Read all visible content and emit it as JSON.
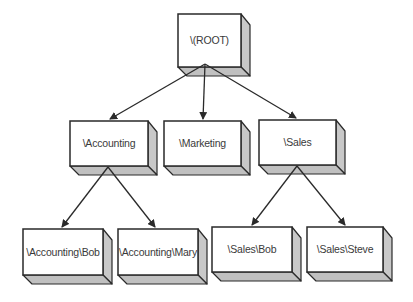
{
  "diagram": {
    "type": "tree",
    "nodes": [
      {
        "id": "root",
        "label": "\\(ROOT)",
        "x": 178,
        "y": 14,
        "w": 63,
        "h": 53
      },
      {
        "id": "accounting",
        "label": "\\Accounting",
        "x": 70,
        "y": 121,
        "w": 78,
        "h": 45
      },
      {
        "id": "marketing",
        "label": "\\Marketing",
        "x": 164,
        "y": 121,
        "w": 77,
        "h": 45
      },
      {
        "id": "sales",
        "label": "\\Sales",
        "x": 259,
        "y": 120,
        "w": 77,
        "h": 45
      },
      {
        "id": "accounting-bob",
        "label": "\\Accounting\\Bob",
        "x": 23,
        "y": 229,
        "w": 80,
        "h": 46
      },
      {
        "id": "accounting-mary",
        "label": "\\Accounting\\Mary",
        "x": 118,
        "y": 229,
        "w": 80,
        "h": 46
      },
      {
        "id": "sales-bob",
        "label": "\\Sales\\Bob",
        "x": 212,
        "y": 227,
        "w": 80,
        "h": 45
      },
      {
        "id": "sales-steve",
        "label": "\\Sales\\Steve",
        "x": 307,
        "y": 227,
        "w": 76,
        "h": 45
      }
    ],
    "edges": [
      {
        "from": "root",
        "to": "accounting",
        "x1": 205,
        "y1": 64,
        "x2": 110,
        "y2": 119
      },
      {
        "from": "root",
        "to": "marketing",
        "x1": 205,
        "y1": 64,
        "x2": 203,
        "y2": 119
      },
      {
        "from": "root",
        "to": "sales",
        "x1": 205,
        "y1": 64,
        "x2": 296,
        "y2": 118
      },
      {
        "from": "accounting",
        "to": "accounting-bob",
        "x1": 108,
        "y1": 167,
        "x2": 62,
        "y2": 227
      },
      {
        "from": "accounting",
        "to": "accounting-mary",
        "x1": 108,
        "y1": 167,
        "x2": 155,
        "y2": 227
      },
      {
        "from": "sales",
        "to": "sales-bob",
        "x1": 297,
        "y1": 166,
        "x2": 252,
        "y2": 225
      },
      {
        "from": "sales",
        "to": "sales-steve",
        "x1": 297,
        "y1": 166,
        "x2": 345,
        "y2": 225
      }
    ],
    "style": {
      "depth": 9,
      "face_color": "#ffffff",
      "side_color": "#c8c8c8",
      "bottom_color": "#c0c0c0",
      "line_color": "#2a2a2a",
      "text_color": "#3a3a3a"
    }
  }
}
